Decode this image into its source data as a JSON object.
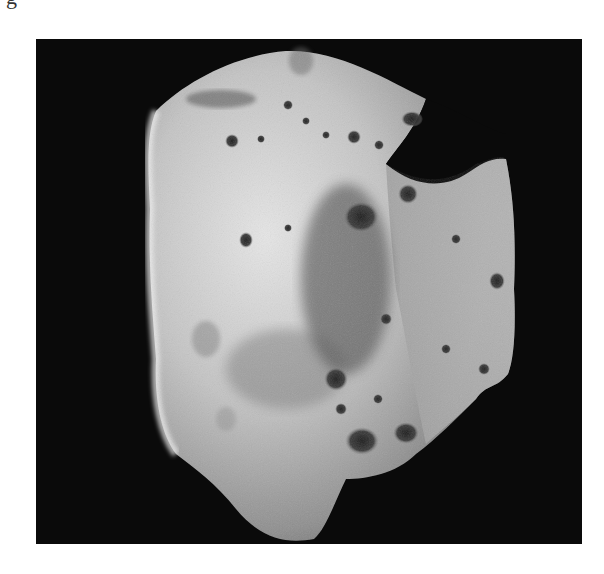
{
  "page": {
    "partial_caption_glyph": "g"
  },
  "figure": {
    "frame": {
      "x": 36,
      "y": 39,
      "width": 546,
      "height": 505
    },
    "colors": {
      "page_background": "#ffffff",
      "space": "#0a0a0a",
      "surface_light": "#e8e8e8",
      "surface_mid": "#a8a8a8",
      "surface_dark": "#4a4a4a",
      "crater_shadow": "#1a1a1a"
    }
  }
}
